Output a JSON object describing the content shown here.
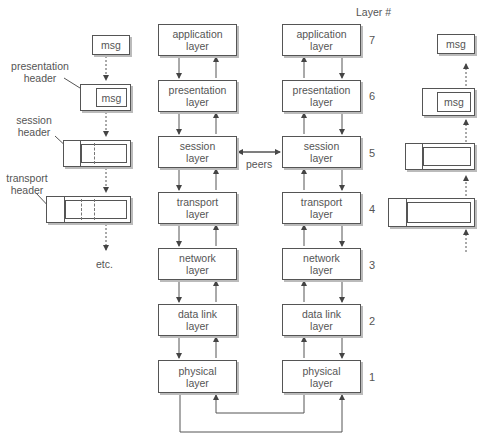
{
  "diagram": {
    "title_column_label": "Layer #",
    "peers_label": "peers",
    "etc_label": "etc.",
    "left_stack": [
      {
        "line1": "application",
        "line2": "layer"
      },
      {
        "line1": "presentation",
        "line2": "layer"
      },
      {
        "line1": "session",
        "line2": "layer"
      },
      {
        "line1": "transport",
        "line2": "layer"
      },
      {
        "line1": "network",
        "line2": "layer"
      },
      {
        "line1": "data link",
        "line2": "layer"
      },
      {
        "line1": "physical",
        "line2": "layer"
      }
    ],
    "right_stack": [
      {
        "line1": "application",
        "line2": "layer"
      },
      {
        "line1": "presentation",
        "line2": "layer"
      },
      {
        "line1": "session",
        "line2": "layer"
      },
      {
        "line1": "transport",
        "line2": "layer"
      },
      {
        "line1": "network",
        "line2": "layer"
      },
      {
        "line1": "data link",
        "line2": "layer"
      },
      {
        "line1": "physical",
        "line2": "layer"
      }
    ],
    "layer_numbers": [
      "7",
      "6",
      "5",
      "4",
      "3",
      "2",
      "1"
    ],
    "encapsulation_left": {
      "msg": "msg",
      "presentation_header_line1": "presentation",
      "presentation_header_line2": "header",
      "session_header_line1": "session",
      "session_header_line2": "header",
      "transport_header_line1": "transport",
      "transport_header_line2": "header"
    },
    "encapsulation_right": {
      "msg": "msg"
    }
  }
}
